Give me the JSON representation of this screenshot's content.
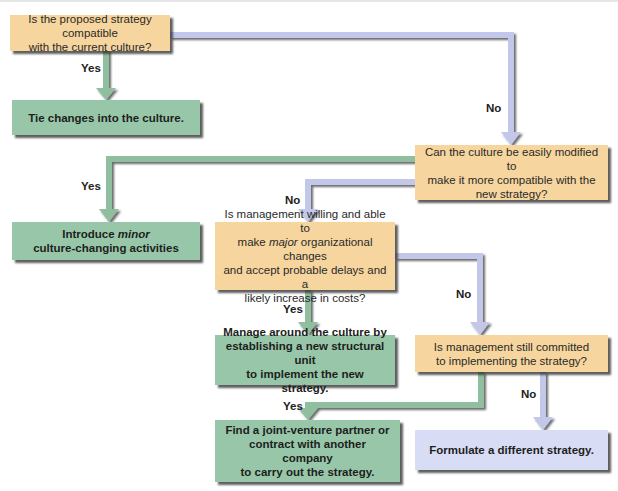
{
  "colors": {
    "question_box": "#f6d59e",
    "action_box": "#97c7a8",
    "alternative_box": "#d8dcf4",
    "yes_connector": "#8fbf9f",
    "no_connector": "#c3c8ea",
    "shadow": "#3a3a3a"
  },
  "nodes": {
    "q1": {
      "type": "question",
      "line1": "Is the proposed strategy compatible",
      "line2": "with the current culture?"
    },
    "a1": {
      "type": "action",
      "text": "Tie changes into the culture."
    },
    "q2": {
      "type": "question",
      "line1": "Can the culture be easily modified to",
      "line2": "make it more compatible with the",
      "line3": "new strategy?"
    },
    "a2": {
      "type": "action",
      "line1_prefix": "Introduce ",
      "line1_emphasis": "minor",
      "line2": "culture-changing activities"
    },
    "q3": {
      "type": "question",
      "line1": "Is management willing and able to",
      "line2_prefix": "make ",
      "line2_emphasis": "major",
      "line2_suffix": " organizational changes",
      "line3": "and accept probable delays and a",
      "line4": "likely increase in costs?"
    },
    "a3": {
      "type": "action",
      "line1": "Manage around the culture by",
      "line2": "establishing a new structural unit",
      "line3": "to implement the new strategy."
    },
    "q4": {
      "type": "question",
      "line1": "Is management still committed",
      "line2": "to implementing the strategy?"
    },
    "a4": {
      "type": "action",
      "line1": "Find a joint-venture partner or",
      "line2": "contract with another company",
      "line3": "to carry out the strategy."
    },
    "a5": {
      "type": "alternative",
      "text": "Formulate a different strategy."
    }
  },
  "edges": [
    {
      "from": "q1",
      "to": "a1",
      "label": "Yes"
    },
    {
      "from": "q1",
      "to": "q2",
      "label": "No"
    },
    {
      "from": "q2",
      "to": "a2",
      "label": "Yes"
    },
    {
      "from": "q2",
      "to": "q3",
      "label": "No"
    },
    {
      "from": "q3",
      "to": "a3",
      "label": "Yes"
    },
    {
      "from": "q3",
      "to": "q4",
      "label": "No"
    },
    {
      "from": "q4",
      "to": "a4",
      "label": "Yes"
    },
    {
      "from": "q4",
      "to": "a5",
      "label": "No"
    }
  ],
  "labels": {
    "yes": "Yes",
    "no": "No"
  }
}
